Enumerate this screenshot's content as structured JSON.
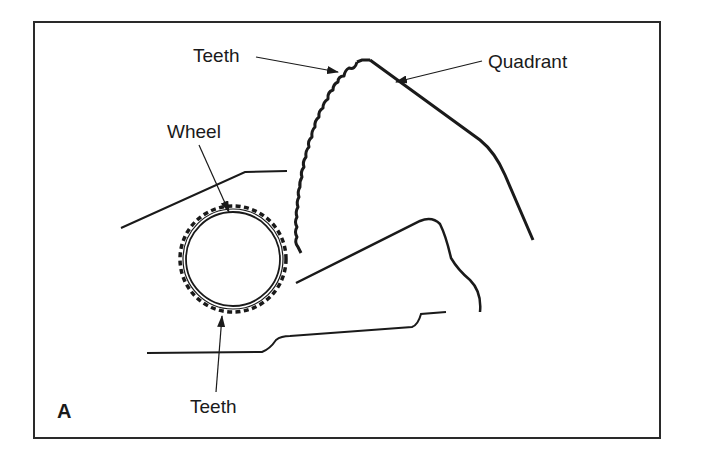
{
  "figure": {
    "panel_letter": "A",
    "colors": {
      "line": "#1a1a1a",
      "background": "#ffffff",
      "frame": "#2a2a2a"
    },
    "labels": {
      "teeth_top": "Teeth",
      "quadrant": "Quadrant",
      "wheel": "Wheel",
      "teeth_bottom": "Teeth"
    },
    "components": [
      {
        "name": "Wheel",
        "description": "Toothed circular gear wheel"
      },
      {
        "name": "Quadrant",
        "description": "Toothed quadrant meshing with the wheel"
      },
      {
        "name": "Teeth",
        "description": "Gear teeth on quadrant arc and on wheel rim"
      }
    ]
  }
}
